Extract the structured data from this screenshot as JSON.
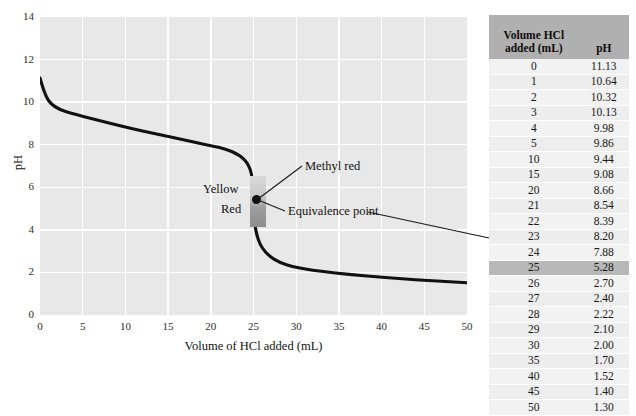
{
  "chart_data": {
    "type": "line",
    "title": "",
    "xlabel": "Volume of HCl added (mL)",
    "ylabel": "pH",
    "xlim": [
      0,
      50
    ],
    "ylim": [
      0,
      14
    ],
    "xticks": [
      0,
      5,
      10,
      15,
      20,
      25,
      30,
      35,
      40,
      45,
      50
    ],
    "yticks": [
      0,
      2,
      4,
      6,
      8,
      10,
      12,
      14
    ],
    "grid": true,
    "legend": "none",
    "series": [
      {
        "name": "Titration curve",
        "x": [
          0,
          1,
          2,
          3,
          4,
          5,
          10,
          15,
          20,
          21,
          22,
          23,
          24,
          25,
          26,
          27,
          28,
          29,
          30,
          35,
          40,
          45,
          50
        ],
        "values": [
          11.13,
          10.64,
          10.32,
          10.13,
          9.98,
          9.86,
          9.44,
          9.08,
          8.66,
          8.54,
          8.39,
          8.2,
          7.88,
          5.28,
          2.7,
          2.4,
          2.22,
          2.1,
          2.0,
          1.7,
          1.52,
          1.4,
          1.3
        ]
      }
    ],
    "annotations": [
      {
        "name": "methyl-red",
        "label": "Methyl red",
        "x": 25,
        "y": 6.4
      },
      {
        "name": "equivalence-point",
        "label": "Equivalence point",
        "x": 25,
        "y": 5.28
      },
      {
        "name": "indicator-upper-color",
        "label": "Yellow",
        "x": 23.2,
        "y": 6.2
      },
      {
        "name": "indicator-lower-color",
        "label": "Red",
        "x": 23.6,
        "y": 5.0
      }
    ],
    "indicator_band": {
      "name": "methyl-red-range",
      "x": 25,
      "ph_low": 4.4,
      "ph_high": 6.8,
      "upper_color_name": "Yellow",
      "lower_color_name": "Red"
    },
    "colors": {
      "plot_background": "#e8e8e8",
      "gridline": "#ffffff",
      "curve": "#111111",
      "band_light": "#d8d8d8",
      "band_dark": "#8d8d8d",
      "table_header_bg": "#b0b0b0",
      "table_row_bg": "#f2f2f2",
      "table_highlight_bg": "#b8b8b8"
    }
  },
  "table": {
    "headers": [
      "Volume HCl added (mL)",
      "pH"
    ],
    "header_line1": "Volume HCl",
    "header_line2": "added (mL)",
    "header_ph": "pH",
    "highlight_volume": "25",
    "rows": [
      {
        "volume": "0",
        "ph": "11.13"
      },
      {
        "volume": "1",
        "ph": "10.64"
      },
      {
        "volume": "2",
        "ph": "10.32"
      },
      {
        "volume": "3",
        "ph": "10.13"
      },
      {
        "volume": "4",
        "ph": "9.98"
      },
      {
        "volume": "5",
        "ph": "9.86"
      },
      {
        "volume": "10",
        "ph": "9.44"
      },
      {
        "volume": "15",
        "ph": "9.08"
      },
      {
        "volume": "20",
        "ph": "8.66"
      },
      {
        "volume": "21",
        "ph": "8.54"
      },
      {
        "volume": "22",
        "ph": "8.39"
      },
      {
        "volume": "23",
        "ph": "8.20"
      },
      {
        "volume": "24",
        "ph": "7.88"
      },
      {
        "volume": "25",
        "ph": "5.28"
      },
      {
        "volume": "26",
        "ph": "2.70"
      },
      {
        "volume": "27",
        "ph": "2.40"
      },
      {
        "volume": "28",
        "ph": "2.22"
      },
      {
        "volume": "29",
        "ph": "2.10"
      },
      {
        "volume": "30",
        "ph": "2.00"
      },
      {
        "volume": "35",
        "ph": "1.70"
      },
      {
        "volume": "40",
        "ph": "1.52"
      },
      {
        "volume": "45",
        "ph": "1.40"
      },
      {
        "volume": "50",
        "ph": "1.30"
      }
    ]
  }
}
